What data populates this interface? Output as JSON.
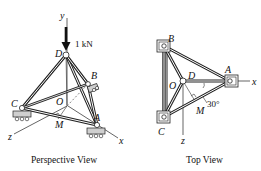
{
  "perspective_view": {
    "caption": "Perspective View",
    "load_label": "1 kN",
    "labels": {
      "y_axis": "y",
      "x_axis": "x",
      "z_axis": "z",
      "D": "D",
      "B": "B",
      "C": "C",
      "O": "O",
      "M": "M",
      "A": "A"
    }
  },
  "top_view": {
    "caption": "Top View",
    "angle_label": "30°",
    "labels": {
      "B": "B",
      "A": "A",
      "x_axis": "x",
      "O": "O",
      "D": "D",
      "M": "M",
      "C": "C",
      "z_axis": "z"
    }
  },
  "colors": {
    "ink": "#111111",
    "member": "#2a2a2a",
    "support_fill": "#cfcfcf"
  }
}
